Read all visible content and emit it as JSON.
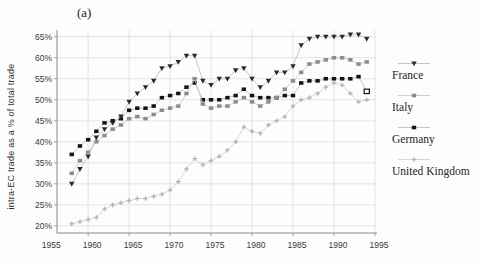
{
  "figure_label": "(a)",
  "chart_data": {
    "type": "line",
    "title": "",
    "xlabel": "",
    "ylabel": "intra-EC trade as a % of total trade",
    "x_ticks": [
      1955,
      1960,
      1965,
      1970,
      1975,
      1980,
      1985,
      1990,
      1995
    ],
    "y_ticks": [
      20,
      25,
      30,
      35,
      40,
      45,
      50,
      55,
      60,
      65
    ],
    "y_tick_suffix": "%",
    "ylim": [
      18.3,
      66.6
    ],
    "xlim": [
      1956.2,
      1995.25
    ],
    "grid": true,
    "legend_position": "right",
    "x": [
      1958,
      1959,
      1960,
      1961,
      1962,
      1963,
      1964,
      1965,
      1966,
      1967,
      1968,
      1969,
      1970,
      1971,
      1972,
      1973,
      1974,
      1975,
      1976,
      1977,
      1978,
      1979,
      1980,
      1981,
      1982,
      1983,
      1984,
      1985,
      1986,
      1987,
      1988,
      1989,
      1990,
      1991,
      1992,
      1993,
      1994
    ],
    "series": [
      {
        "name": "France",
        "marker": "triangle",
        "marker_color": "#2a2a2a",
        "line_color": "#c0c0c0",
        "values": [
          30,
          33.5,
          36.5,
          41,
          43,
          44.5,
          46,
          49.5,
          51.5,
          53,
          54.5,
          57.5,
          58,
          59,
          60.5,
          60.5,
          54.5,
          53.5,
          55,
          55,
          57,
          57.5,
          55,
          53,
          54.5,
          56.5,
          56.5,
          58,
          63,
          64.5,
          65,
          65,
          65,
          65,
          65.5,
          65.5,
          64.5
        ]
      },
      {
        "name": "Italy",
        "marker": "square",
        "marker_color": "#8c8c8c",
        "line_color": "#cacaca",
        "values": [
          32.5,
          35.5,
          37.5,
          40,
          41.5,
          43,
          44,
          45.5,
          46,
          45.5,
          46.5,
          47.5,
          48,
          48.5,
          51.5,
          55,
          49,
          48,
          48.5,
          48.5,
          49.5,
          50.5,
          49.5,
          48.5,
          49.5,
          50.5,
          52.5,
          54.5,
          56.5,
          58.5,
          59,
          59.5,
          60,
          60,
          59.5,
          58.5,
          59
        ]
      },
      {
        "name": "Germany",
        "marker": "square",
        "marker_color": "#141414",
        "line_color": "#c0c0c0",
        "last_point_open": true,
        "values": [
          37,
          39,
          40.5,
          42.5,
          44.5,
          45,
          45.5,
          47.5,
          48,
          48,
          48.5,
          50.5,
          51,
          51.5,
          53,
          54,
          50,
          50,
          50,
          50.5,
          51,
          52.5,
          51,
          50.5,
          50.5,
          50.5,
          51,
          51,
          54,
          54.5,
          54.5,
          55,
          55,
          55,
          55,
          55.5,
          52
        ]
      },
      {
        "name": "United Kingdom",
        "marker": "plus",
        "marker_color": "#b3b3b3",
        "line_color": "#d4d4d4",
        "values": [
          20.5,
          21,
          21.5,
          22,
          24,
          25,
          25.5,
          26,
          26.5,
          26.5,
          27,
          27.5,
          28.5,
          30.5,
          33.5,
          36,
          34.5,
          35.5,
          36.5,
          38,
          40,
          43.5,
          42.5,
          42,
          44,
          45,
          46,
          48.5,
          50,
          50.5,
          51.5,
          53,
          54,
          53.5,
          51.5,
          49.5,
          50
        ]
      }
    ]
  }
}
